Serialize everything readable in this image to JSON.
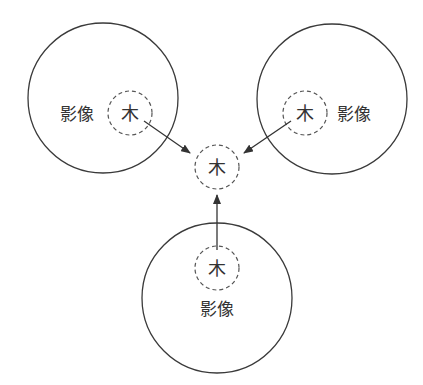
{
  "diagram": {
    "colors": {
      "stroke": "#3a3a3a",
      "dashed": "#555555",
      "text": "#333333",
      "background": "#ffffff"
    },
    "images": [
      {
        "id": "left",
        "outer": {
          "cx": 103,
          "cy": 98,
          "r": 75
        },
        "inner": {
          "cx": 130,
          "cy": 113,
          "r": 22
        },
        "tree_label": "木",
        "image_label": "影像",
        "label_pos": {
          "x": 77,
          "y": 120
        }
      },
      {
        "id": "right",
        "outer": {
          "cx": 332,
          "cy": 99,
          "r": 75
        },
        "inner": {
          "cx": 305,
          "cy": 113,
          "r": 22
        },
        "tree_label": "木",
        "image_label": "影像",
        "label_pos": {
          "x": 354,
          "y": 120
        }
      },
      {
        "id": "bottom",
        "outer": {
          "cx": 217,
          "cy": 298,
          "r": 75
        },
        "inner": {
          "cx": 217,
          "cy": 268,
          "r": 22
        },
        "tree_label": "木",
        "image_label": "影像",
        "label_pos": {
          "x": 217,
          "y": 315
        }
      }
    ],
    "target": {
      "cx": 217,
      "cy": 167,
      "r": 22,
      "label": "木"
    },
    "arrows": [
      {
        "from": [
          144,
          121
        ],
        "to": [
          190,
          153
        ]
      },
      {
        "from": [
          291,
          121
        ],
        "to": [
          244,
          153
        ]
      },
      {
        "from": [
          217,
          250
        ],
        "to": [
          217,
          195
        ]
      }
    ]
  }
}
